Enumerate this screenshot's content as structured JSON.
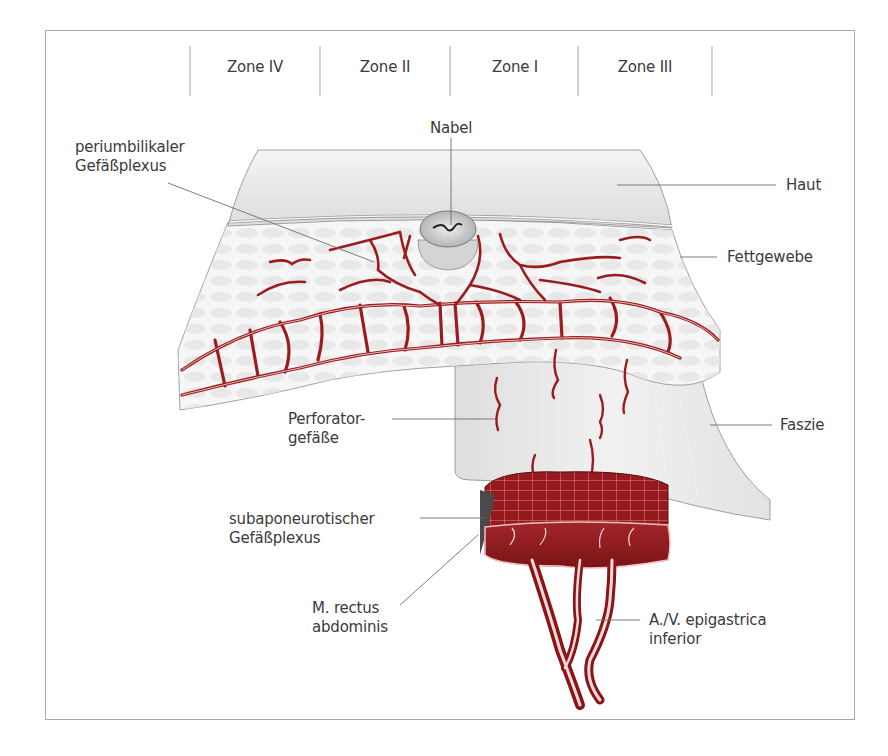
{
  "figure": {
    "zones": [
      {
        "label": "Zone IV"
      },
      {
        "label": "Zone II"
      },
      {
        "label": "Zone I"
      },
      {
        "label": "Zone III"
      }
    ],
    "labels": {
      "periumbilical": {
        "line1": "periumbilikaler",
        "line2": "Gefäßplexus"
      },
      "nabel": "Nabel",
      "haut": "Haut",
      "fettgewebe": "Fettgewebe",
      "perforator": {
        "line1": "Perforator-",
        "line2": "gefäße"
      },
      "faszie": "Faszie",
      "subaponeurotic": {
        "line1": "subaponeurotischer",
        "line2": "Gefäßplexus"
      },
      "rectus": {
        "line1": "M. rectus",
        "line2": "abdominis"
      },
      "epigastrica": {
        "line1": "A./V. epigastrica",
        "line2": "inferior"
      }
    },
    "colors": {
      "vessel": "#9b1c1f",
      "muscle": "#8e1a1d",
      "skin": "#e6e6e6",
      "fat": "#f2f2f2",
      "fascia": "#e9e9e9",
      "leader": "#6e6e6e",
      "frame": "#a8a8a8"
    }
  }
}
